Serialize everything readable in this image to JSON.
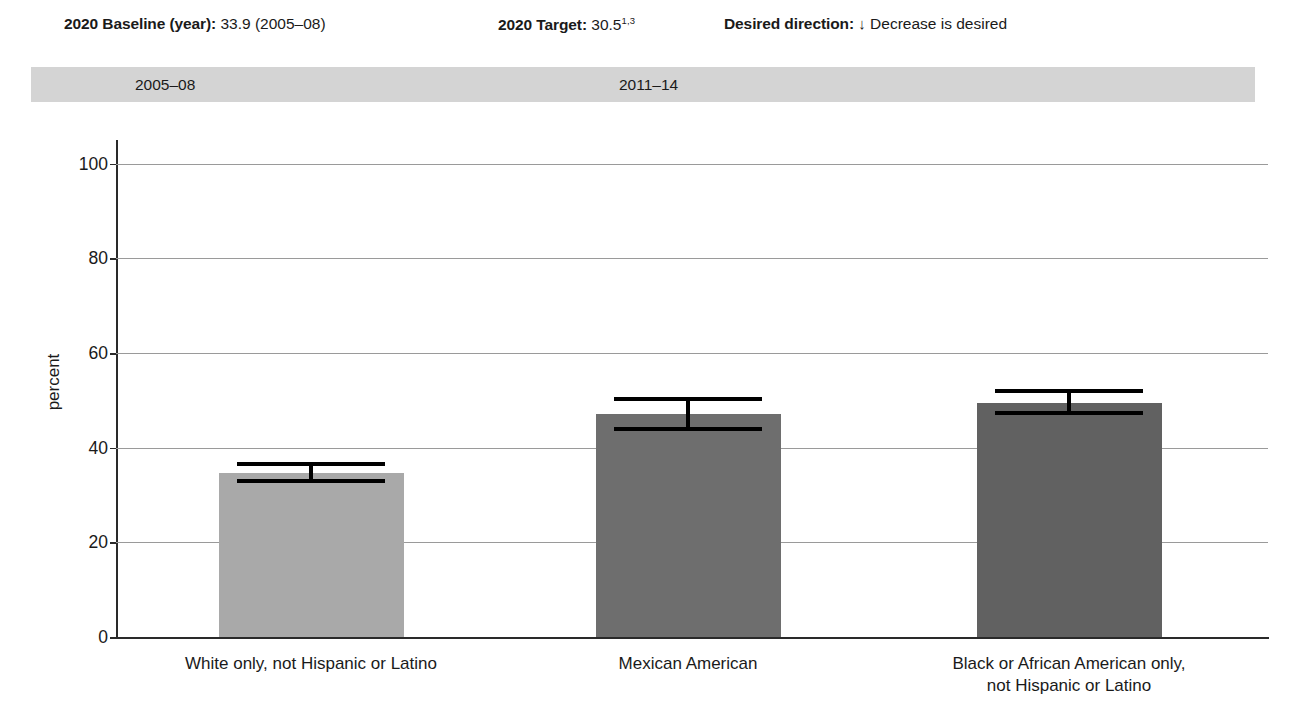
{
  "header": {
    "baseline_label": "2020 Baseline (year):",
    "baseline_value": "33.9 (2005–08)",
    "target_label": "2020 Target:",
    "target_value": "30.5",
    "target_footnote": "1,3",
    "direction_label": "Desired direction:",
    "direction_arrow": "↓",
    "direction_value": "Decrease is desired"
  },
  "period_band": {
    "periods": [
      {
        "label": "2005–08"
      },
      {
        "label": "2011–14"
      }
    ]
  },
  "chart_data": {
    "type": "bar",
    "title": "",
    "xlabel": "",
    "ylabel": "percent",
    "ylim": [
      0,
      105
    ],
    "yticks": [
      0,
      20,
      40,
      60,
      80,
      100
    ],
    "ytick_labels": [
      "0",
      "20",
      "40",
      "60",
      "80",
      "100"
    ],
    "grid": true,
    "legend": "none",
    "categories": [
      "White only, not Hispanic or Latino",
      "Mexican American",
      "Black or African American only, not Hispanic or Latino"
    ],
    "category_lines": [
      [
        "White only, not Hispanic or Latino"
      ],
      [
        "Mexican American"
      ],
      [
        "Black or African American only,",
        "not Hispanic or Latino"
      ]
    ],
    "values": [
      34.6,
      47.1,
      49.4
    ],
    "error_low": [
      32.5,
      43.5,
      46.8
    ],
    "error_high": [
      37.0,
      50.8,
      52.3
    ],
    "bar_colors": [
      "#a9a9a9",
      "#6e6e6e",
      "#616161"
    ],
    "period_of_bars": [
      "2005–08",
      "2011–14",
      "2011–14"
    ]
  },
  "colors": {
    "band_background": "#d4d4d4",
    "gridline": "#9a9a9a",
    "axis": "#2a2a2a",
    "text": "#1a1a1a",
    "error_bar": "#000000"
  }
}
